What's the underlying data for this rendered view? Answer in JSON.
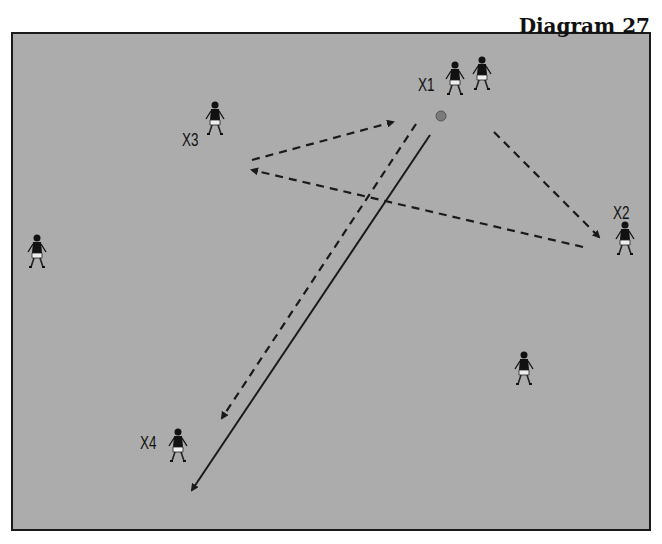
{
  "diagram": {
    "title": "Diagram 27",
    "colors": {
      "pitch": "#acacac",
      "border": "#1a1a1a",
      "lines": "#1a1a1a",
      "ball": "#7a7a7a"
    },
    "players": [
      {
        "label": "X1",
        "x": 455,
        "y": 85
      },
      {
        "label": "",
        "x": 482,
        "y": 80
      },
      {
        "label": "X3",
        "x": 215,
        "y": 125
      },
      {
        "label": "X2",
        "x": 625,
        "y": 245
      },
      {
        "label": "",
        "x": 37,
        "y": 258
      },
      {
        "label": "",
        "x": 524,
        "y": 375
      },
      {
        "label": "X4",
        "x": 178,
        "y": 452
      }
    ],
    "labels": [
      {
        "text": "X1",
        "x": 418,
        "y": 75
      },
      {
        "text": "X3",
        "x": 182,
        "y": 130
      },
      {
        "text": "X2",
        "x": 613,
        "y": 203
      },
      {
        "text": "X4",
        "x": 140,
        "y": 433
      }
    ],
    "ball": {
      "x": 441,
      "y": 116
    },
    "passes": [
      {
        "type": "dashed",
        "from": [
          252,
          160
        ],
        "to": [
          393,
          122
        ]
      },
      {
        "type": "dashed",
        "from": [
          583,
          247
        ],
        "to": [
          252,
          170
        ]
      },
      {
        "type": "dashed",
        "from": [
          494,
          132
        ],
        "to": [
          599,
          237
        ]
      },
      {
        "type": "dashed",
        "from": [
          416,
          124
        ],
        "to": [
          222,
          418
        ]
      },
      {
        "type": "solid",
        "from": [
          430,
          135
        ],
        "to": [
          192,
          490
        ]
      }
    ]
  }
}
